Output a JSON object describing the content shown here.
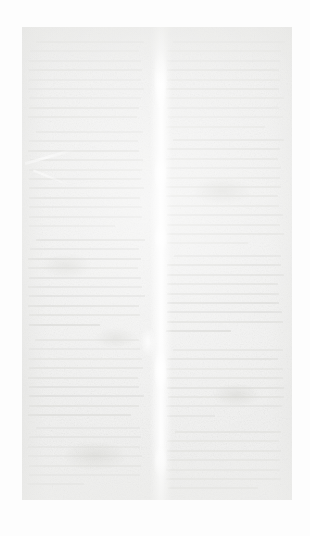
{
  "document": {
    "kind": "scanned-page",
    "legibility": "illegible",
    "condition_note": "severely faded, washed-out grayscale scan; no glyph content readable",
    "layout": "two-column text block with central binding gutter",
    "orientation": "portrait",
    "visible_text": ""
  },
  "canvas": {
    "width": 310,
    "height": 536,
    "background_color": "#fcfcfc"
  },
  "page_sheet": {
    "left": 22,
    "top": 27,
    "width": 270,
    "height": 473,
    "paper_color": "#f1f1f0",
    "ink_color": "#d9d9d6",
    "highlight_color": "#ffffff"
  },
  "columns": [
    {
      "name": "left-column",
      "left": 6,
      "width": 120,
      "blocks": [
        {
          "top": 14,
          "lines": 9,
          "leading": 9.4,
          "last_line_width": 0.93,
          "tone": "dim"
        },
        {
          "top": 104,
          "lines": 11,
          "leading": 9.4,
          "last_line_width": 0.74,
          "tone": "normal"
        },
        {
          "top": 212,
          "lines": 10,
          "leading": 9.4,
          "last_line_width": 0.61,
          "tone": "dark"
        },
        {
          "top": 312,
          "lines": 9,
          "leading": 9.4,
          "last_line_width": 0.88,
          "tone": "normal"
        },
        {
          "top": 400,
          "lines": 7,
          "leading": 9.4,
          "last_line_width": 0.48,
          "tone": "dim"
        }
      ]
    },
    {
      "name": "right-column",
      "left": 144,
      "width": 122,
      "blocks": [
        {
          "top": 14,
          "lines": 10,
          "leading": 9.4,
          "last_line_width": 0.83,
          "tone": "dim"
        },
        {
          "top": 112,
          "lines": 12,
          "leading": 9.4,
          "last_line_width": 0.69,
          "tone": "normal"
        },
        {
          "top": 228,
          "lines": 9,
          "leading": 9.4,
          "last_line_width": 0.55,
          "tone": "dark"
        },
        {
          "top": 322,
          "lines": 8,
          "leading": 9.4,
          "last_line_width": 0.41,
          "tone": "normal"
        },
        {
          "top": 404,
          "lines": 7,
          "leading": 9.4,
          "last_line_width": 0.77,
          "tone": "dim"
        }
      ]
    }
  ],
  "binding_gutter": {
    "name": "binding-gutter",
    "center_x": 157,
    "width": 22,
    "description": "bright vertical fold/crease running the full page height"
  },
  "fold_flares": [
    {
      "top": 18,
      "height": 66
    },
    {
      "top": 128,
      "height": 38
    },
    {
      "top": 196,
      "height": 30
    },
    {
      "top": 322,
      "height": 44
    },
    {
      "top": 418,
      "height": 34
    }
  ],
  "blotches": [
    {
      "left": 18,
      "top": 226,
      "width": 52,
      "height": 26
    },
    {
      "left": 72,
      "top": 300,
      "width": 44,
      "height": 22
    },
    {
      "left": 170,
      "top": 150,
      "width": 60,
      "height": 28
    },
    {
      "left": 190,
      "top": 356,
      "width": 48,
      "height": 24
    },
    {
      "left": 40,
      "top": 414,
      "width": 66,
      "height": 30
    }
  ]
}
